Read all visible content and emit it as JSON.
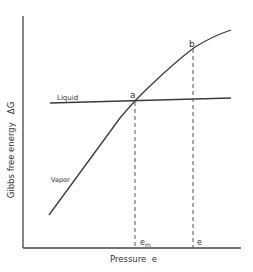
{
  "diagram": {
    "type": "gibbs-free-energy-vs-pressure",
    "y_axis_label": "Gibbs free energy   ΔG",
    "x_axis_label": "Pressure  e",
    "curves": [
      {
        "name": "Liquid",
        "label": "Liquid"
      },
      {
        "name": "Vapor",
        "label": "Vapor"
      }
    ],
    "points": {
      "a": "a",
      "b": "b"
    },
    "x_markers": {
      "e_m_base": "e",
      "e_m_sub": "m",
      "e": "e"
    },
    "colors": {
      "line": "#3a3a3a",
      "text": "#333333",
      "background": "#ffffff"
    }
  }
}
